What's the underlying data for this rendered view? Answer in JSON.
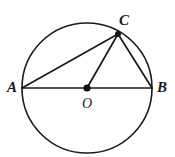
{
  "diagram": {
    "background_color": "#ffffff",
    "stroke_color": "#1a1a1a",
    "canvas": {
      "width": 175,
      "height": 157
    },
    "circle": {
      "name": "circle-O",
      "center_x": 87,
      "center_y": 88,
      "radius": 65,
      "stroke_width": 1.6
    },
    "points": [
      {
        "id": "A",
        "label": "A",
        "x": 22,
        "y": 88,
        "label_x": 12,
        "label_y": 92,
        "on_circle": true,
        "dot_visible": false
      },
      {
        "id": "B",
        "label": "B",
        "x": 152,
        "y": 88,
        "label_x": 162,
        "label_y": 92,
        "on_circle": true,
        "dot_visible": false
      },
      {
        "id": "C",
        "label": "C",
        "x": 118,
        "y": 34,
        "label_x": 124,
        "label_y": 25,
        "on_circle": true,
        "dot_visible": true,
        "dot_radius": 3
      },
      {
        "id": "O",
        "label": "O",
        "x": 87,
        "y": 88,
        "label_x": 87,
        "label_y": 108,
        "on_circle": false,
        "dot_visible": true,
        "dot_radius": 3.6
      }
    ],
    "segments": [
      {
        "name": "segment-AB",
        "kind": "diameter",
        "from": "A",
        "to": "B",
        "x1": 22,
        "y1": 88,
        "x2": 152,
        "y2": 88
      },
      {
        "name": "segment-AC",
        "kind": "chord",
        "from": "A",
        "to": "C",
        "x1": 22,
        "y1": 88,
        "x2": 118,
        "y2": 34
      },
      {
        "name": "segment-CB",
        "kind": "chord",
        "from": "C",
        "to": "B",
        "x1": 118,
        "y1": 34,
        "x2": 152,
        "y2": 88
      },
      {
        "name": "segment-CO",
        "kind": "radius",
        "from": "C",
        "to": "O",
        "x1": 118,
        "y1": 34,
        "x2": 87,
        "y2": 88
      }
    ]
  }
}
